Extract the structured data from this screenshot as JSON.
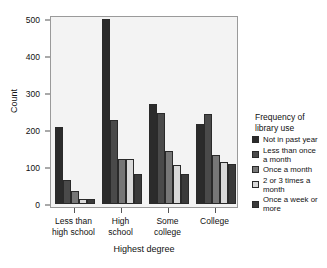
{
  "chart_data": {
    "type": "bar",
    "title": "",
    "xlabel": "Highest degree",
    "ylabel": "Count",
    "categories": [
      "Less than high school",
      "High school",
      "Some college",
      "College"
    ],
    "category_lines": [
      [
        "Less than",
        "high school"
      ],
      [
        "High",
        "school"
      ],
      [
        "Some",
        "college"
      ],
      [
        "College"
      ]
    ],
    "series": [
      {
        "name": "Not in past year",
        "values": [
          208,
          499,
          270,
          215
        ],
        "color": "#2b2b2b"
      },
      {
        "name": "Less than once a month",
        "values": [
          65,
          228,
          246,
          243
        ],
        "color": "#4a4a4a"
      },
      {
        "name": "Once a month",
        "values": [
          35,
          122,
          144,
          133
        ],
        "color": "#777777"
      },
      {
        "name": "2 or 3 times a month",
        "values": [
          14,
          121,
          106,
          114
        ],
        "color": "#d9d9d9"
      },
      {
        "name": "Once a week or more",
        "values": [
          14,
          82,
          81,
          107
        ],
        "color": "#3a3a3a"
      }
    ],
    "ylim": [
      0,
      520
    ],
    "yticks": [
      0,
      100,
      200,
      300,
      400,
      500
    ],
    "ytick_labels": [
      "0",
      "100",
      "200",
      "300",
      "400",
      "500"
    ],
    "grid": false,
    "legend_position": "right",
    "legend_title_lines": [
      "Frequency of",
      "library use"
    ],
    "legend_labels_wrapped": [
      [
        "Not in past year"
      ],
      [
        "Less than once",
        "a month"
      ],
      [
        "Once a month"
      ],
      [
        "2 or 3 times a",
        "month"
      ],
      [
        "Once a week or",
        "more"
      ]
    ],
    "panel_background": "#f3f3f3",
    "panel_border": "#9a9a9a"
  }
}
